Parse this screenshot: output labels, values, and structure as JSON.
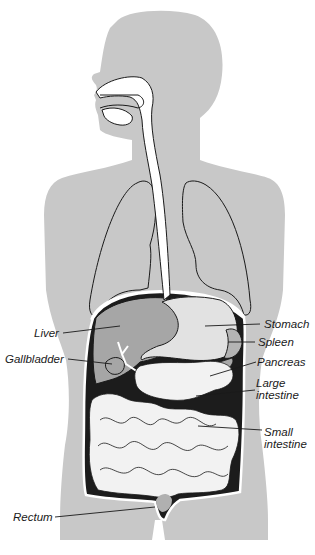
{
  "figure": {
    "colors": {
      "background": "#ffffff",
      "silhouette": "#c8c8c8",
      "tract": "#ffffff",
      "liver": "#a6a6a6",
      "stomach": "#e2e2e2",
      "spleen": "#b4b4b4",
      "abdominal_cavity": "#1c1c1c",
      "intestine": "#f2f2f2",
      "rectum": "#b0b0b0",
      "outline": "#1a1a1a"
    }
  },
  "labels": {
    "liver": "Liver",
    "gallbladder": "Gallbladder",
    "stomach": "Stomach",
    "spleen": "Spleen",
    "pancreas": "Pancreas",
    "large_intestine": "Large\nintestine",
    "small_intestine": "Small\nintestine",
    "rectum": "Rectum"
  }
}
